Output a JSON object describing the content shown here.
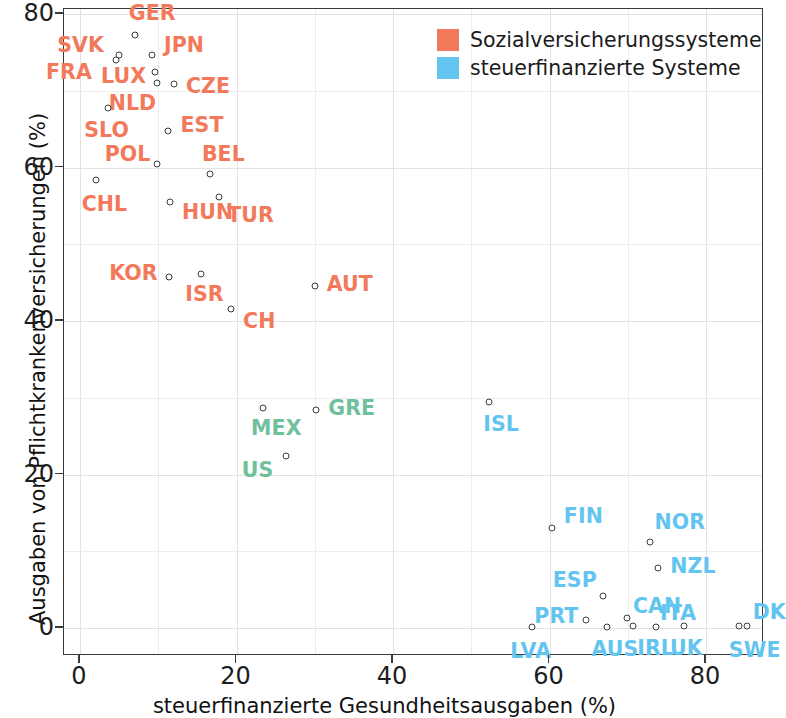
{
  "chart_data": {
    "type": "scatter",
    "title": "",
    "xlabel": "steuerfinanzierte Gesundheitsausgaben (%)",
    "ylabel": "Ausgaben von Pflichtkrankenversicherungen (%)",
    "xlim": [
      -2,
      87.5
    ],
    "ylim": [
      -4,
      82.5
    ],
    "xticks": [
      0,
      20,
      40,
      60,
      80
    ],
    "yticks": [
      0,
      20,
      40,
      60,
      80
    ],
    "grid": true,
    "grid_step": 10,
    "legend_position": "top-right",
    "series": [
      {
        "name": "Sozialversicherungssysteme",
        "color": "#f2795a",
        "points": [
          {
            "label": "GER",
            "x": 7.0,
            "y": 77.3,
            "lx": -6,
            "ly": -22
          },
          {
            "label": "SVK",
            "x": 5.0,
            "y": 74.6,
            "lx": -62,
            "ly": -10
          },
          {
            "label": "JPN",
            "x": 9.2,
            "y": 74.6,
            "lx": 12,
            "ly": -10
          },
          {
            "label": "FRA",
            "x": 4.6,
            "y": 74.0,
            "lx": -70,
            "ly": 12
          },
          {
            "label": "LUX",
            "x": 9.6,
            "y": 72.5,
            "lx": -54,
            "ly": 4
          },
          {
            "label": "NLD",
            "x": 9.8,
            "y": 71.0,
            "lx": -48,
            "ly": 20
          },
          {
            "label": "CZE",
            "x": 12.0,
            "y": 70.9,
            "lx": 12,
            "ly": 2
          },
          {
            "label": "SLO",
            "x": 3.6,
            "y": 67.8,
            "lx": -24,
            "ly": 22
          },
          {
            "label": "EST",
            "x": 11.3,
            "y": 64.8,
            "lx": 12,
            "ly": -6
          },
          {
            "label": "POL",
            "x": 9.8,
            "y": 60.5,
            "lx": -52,
            "ly": -10
          },
          {
            "label": "BEL",
            "x": 16.6,
            "y": 59.1,
            "lx": -8,
            "ly": -20
          },
          {
            "label": "CHL",
            "x": 2.0,
            "y": 58.4,
            "lx": -14,
            "ly": 24
          },
          {
            "label": "HUN",
            "x": 11.5,
            "y": 55.5,
            "lx": 12,
            "ly": 10
          },
          {
            "label": "TUR",
            "x": 17.8,
            "y": 56.2,
            "lx": 8,
            "ly": 18
          },
          {
            "label": "KOR",
            "x": 11.4,
            "y": 45.7,
            "lx": -60,
            "ly": -4
          },
          {
            "label": "ISR",
            "x": 15.5,
            "y": 46.1,
            "lx": -16,
            "ly": 20
          },
          {
            "label": "CH",
            "x": 19.3,
            "y": 41.5,
            "lx": 12,
            "ly": 12
          },
          {
            "label": "AUT",
            "x": 30.0,
            "y": 44.6,
            "lx": 12,
            "ly": -2
          }
        ]
      },
      {
        "name": "Mischsysteme",
        "color": "#6fc19c",
        "points": [
          {
            "label": "MEX",
            "x": 23.4,
            "y": 28.6,
            "lx": -12,
            "ly": 20
          },
          {
            "label": "GRE",
            "x": 30.2,
            "y": 28.4,
            "lx": 12,
            "ly": -2
          },
          {
            "label": "US",
            "x": 26.3,
            "y": 22.4,
            "lx": -44,
            "ly": 14
          }
        ]
      },
      {
        "name": "steuerfinanzierte Systeme",
        "color": "#63c5ef",
        "points": [
          {
            "label": "ISL",
            "x": 52.3,
            "y": 29.4,
            "lx": -6,
            "ly": 22
          },
          {
            "label": "FIN",
            "x": 60.3,
            "y": 13.0,
            "lx": 12,
            "ly": -12
          },
          {
            "label": "NOR",
            "x": 72.9,
            "y": 11.2,
            "lx": 4,
            "ly": -20
          },
          {
            "label": "NZL",
            "x": 73.9,
            "y": 7.8,
            "lx": 12,
            "ly": -2
          },
          {
            "label": "ESP",
            "x": 66.8,
            "y": 4.2,
            "lx": -50,
            "ly": -16
          },
          {
            "label": "PRT",
            "x": 64.7,
            "y": 1.1,
            "lx": -52,
            "ly": -4
          },
          {
            "label": "CAN",
            "x": 69.9,
            "y": 1.3,
            "lx": 6,
            "ly": -12
          },
          {
            "label": "AUS",
            "x": 67.4,
            "y": 0.1,
            "lx": -16,
            "ly": 22
          },
          {
            "label": "IRL",
            "x": 70.7,
            "y": 0.3,
            "lx": 4,
            "ly": 22
          },
          {
            "label": "ITA",
            "x": 73.6,
            "y": 0.1,
            "lx": 4,
            "ly": -14
          },
          {
            "label": "UK",
            "x": 77.2,
            "y": 0.2,
            "lx": -14,
            "ly": 22
          },
          {
            "label": "LVA",
            "x": 57.8,
            "y": 0.1,
            "lx": -22,
            "ly": 24
          },
          {
            "label": "SWE",
            "x": 84.2,
            "y": 0.2,
            "lx": -10,
            "ly": 24
          },
          {
            "label": "DK",
            "x": 85.2,
            "y": 0.2,
            "lx": 6,
            "ly": -14
          }
        ]
      }
    ]
  },
  "legend": {
    "entries": [
      {
        "label": "Sozialversicherungssysteme",
        "color": "#f2795a"
      },
      {
        "label": "steuerfinanzierte Systeme",
        "color": "#63c5ef"
      }
    ]
  }
}
